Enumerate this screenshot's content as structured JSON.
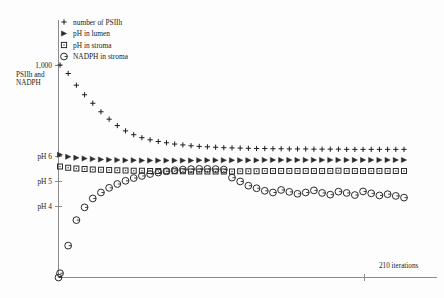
{
  "chart_data": {
    "type": "scatter",
    "title": "",
    "xlabel": "210 iterations",
    "ylabel_top": "1,000",
    "ylabel_top_sub": "PSIIh and NADPH",
    "grid": false,
    "legend_position": "top-left",
    "xlim": [
      0,
      210
    ],
    "x_tick_labels": [
      "210 iterations"
    ],
    "y_tick_labels": [
      "1,000",
      "pH 6",
      "pH 5",
      "pH 4"
    ],
    "y_axis_note": "dual axis: counts (PSIIh and NADPH) and pH",
    "x": [
      0,
      5,
      10,
      15,
      20,
      25,
      30,
      35,
      40,
      45,
      50,
      55,
      60,
      65,
      70,
      75,
      80,
      85,
      90,
      95,
      100,
      105,
      110,
      115,
      120,
      125,
      130,
      135,
      140,
      145,
      150,
      155,
      160,
      165,
      170,
      175,
      180,
      185,
      190,
      195,
      200,
      205,
      210
    ],
    "series": [
      {
        "name": "number of PSIIh",
        "marker": "plus",
        "values": [
          1000,
          960,
          905,
          860,
          820,
          780,
          745,
          715,
          690,
          672,
          658,
          648,
          640,
          634,
          628,
          624,
          620,
          617,
          615,
          613,
          611,
          610,
          609,
          608,
          607,
          607,
          606,
          606,
          605,
          605,
          605,
          604,
          604,
          604,
          604,
          603,
          603,
          603,
          603,
          603,
          603,
          603,
          603
        ]
      },
      {
        "name": "pH in lumen",
        "marker": "triangle-right",
        "values": [
          6.05,
          5.97,
          5.93,
          5.9,
          5.88,
          5.86,
          5.85,
          5.84,
          5.83,
          5.83,
          5.82,
          5.82,
          5.82,
          5.82,
          5.82,
          5.82,
          5.82,
          5.83,
          5.83,
          5.83,
          5.83,
          5.83,
          5.83,
          5.83,
          5.83,
          5.84,
          5.84,
          5.84,
          5.84,
          5.84,
          5.84,
          5.84,
          5.84,
          5.84,
          5.84,
          5.84,
          5.84,
          5.84,
          5.84,
          5.84,
          5.84,
          5.84,
          5.84
        ]
      },
      {
        "name": "pH in stroma",
        "marker": "square",
        "values": [
          5.58,
          5.53,
          5.5,
          5.48,
          5.46,
          5.45,
          5.44,
          5.43,
          5.42,
          5.41,
          5.41,
          5.4,
          5.4,
          5.39,
          5.39,
          5.39,
          5.38,
          5.38,
          5.38,
          5.38,
          5.38,
          5.38,
          5.39,
          5.39,
          5.39,
          5.4,
          5.4,
          5.4,
          5.4,
          5.4,
          5.4,
          5.4,
          5.4,
          5.4,
          5.41,
          5.4,
          5.4,
          5.4,
          5.4,
          5.4,
          5.4,
          5.4,
          5.4
        ]
      },
      {
        "name": "NADPH in stroma",
        "marker": "circle",
        "values": [
          20,
          150,
          270,
          330,
          372,
          400,
          422,
          440,
          455,
          468,
          478,
          487,
          494,
          500,
          505,
          508,
          510,
          511,
          511,
          510,
          508,
          470,
          452,
          432,
          420,
          408,
          400,
          412,
          403,
          394,
          400,
          410,
          398,
          390,
          404,
          398,
          388,
          405,
          396,
          386,
          392,
          384,
          376
        ]
      }
    ]
  },
  "legend": {
    "items": [
      {
        "marker": "plus",
        "label": "number of PSIIh"
      },
      {
        "marker": "triangle-right",
        "label": "pH in lumen"
      },
      {
        "marker": "square",
        "label": "pH in stroma"
      },
      {
        "marker": "circle",
        "label": "NADPH in stroma"
      }
    ]
  },
  "axes": {
    "y_labels": [
      {
        "text": "1,000",
        "y": 65
      },
      {
        "text": "pH 6",
        "y": 156
      },
      {
        "text": "pH 5",
        "y": 181
      },
      {
        "text": "pH 4",
        "y": 206
      }
    ],
    "y_caption_line1": "PSIIh and",
    "y_caption_line2": "NADPH",
    "x_caption": "210 iterations"
  },
  "colors": {
    "background": "#fdfdfd",
    "axis": "#8a8a8a",
    "marker": "#2b2b2b",
    "text": "#1c1c1c"
  }
}
